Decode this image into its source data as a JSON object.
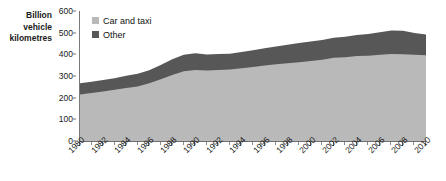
{
  "chart_data": {
    "type": "area",
    "title": "",
    "subtitle": "",
    "xlabel": "",
    "ylabel": "Billion vehicle kilometres",
    "ylabel_lines": [
      "Billion",
      "vehicle",
      "kilometres"
    ],
    "ylim": [
      0,
      600
    ],
    "y_ticks": [
      0,
      100,
      200,
      300,
      400,
      500,
      600
    ],
    "y_tick_labels": [
      "0",
      "100",
      "200",
      "300",
      "400",
      "500",
      "600"
    ],
    "grid": false,
    "stacked": true,
    "legend_position": "top-left",
    "x": [
      1980,
      1981,
      1982,
      1983,
      1984,
      1985,
      1986,
      1987,
      1988,
      1989,
      1990,
      1991,
      1992,
      1993,
      1994,
      1995,
      1996,
      1997,
      1998,
      1999,
      2000,
      2001,
      2002,
      2003,
      2004,
      2005,
      2006,
      2007,
      2008,
      2009,
      2010
    ],
    "x_tick_labels": [
      "1980",
      "1982",
      "1984",
      "1986",
      "1988",
      "1990",
      "1992",
      "1994",
      "1996",
      "1998",
      "2000",
      "2002",
      "2004",
      "2006",
      "2008",
      "2010"
    ],
    "xlim": [
      1980,
      2010
    ],
    "series": [
      {
        "name": "Car and taxi",
        "color": "#b9b9b9",
        "values": [
          215,
          222,
          228,
          236,
          245,
          252,
          266,
          285,
          305,
          322,
          328,
          325,
          328,
          330,
          336,
          342,
          349,
          354,
          359,
          364,
          369,
          375,
          384,
          387,
          392,
          394,
          398,
          402,
          400,
          398,
          396
        ]
      },
      {
        "name": "Other",
        "color": "#575757",
        "values": [
          52,
          52,
          53,
          54,
          56,
          58,
          61,
          66,
          72,
          76,
          77,
          74,
          73,
          73,
          75,
          77,
          79,
          82,
          85,
          88,
          90,
          91,
          92,
          94,
          97,
          100,
          104,
          108,
          109,
          100,
          96
        ]
      }
    ],
    "totals": [
      267,
      274,
      281,
      290,
      301,
      310,
      327,
      351,
      377,
      398,
      405,
      399,
      401,
      403,
      411,
      419,
      428,
      436,
      444,
      452,
      459,
      466,
      476,
      481,
      489,
      494,
      502,
      510,
      509,
      498,
      492
    ]
  },
  "legend": {
    "items": [
      {
        "label": "Car and taxi",
        "color": "#b9b9b9"
      },
      {
        "label": "Other",
        "color": "#575757"
      }
    ]
  }
}
